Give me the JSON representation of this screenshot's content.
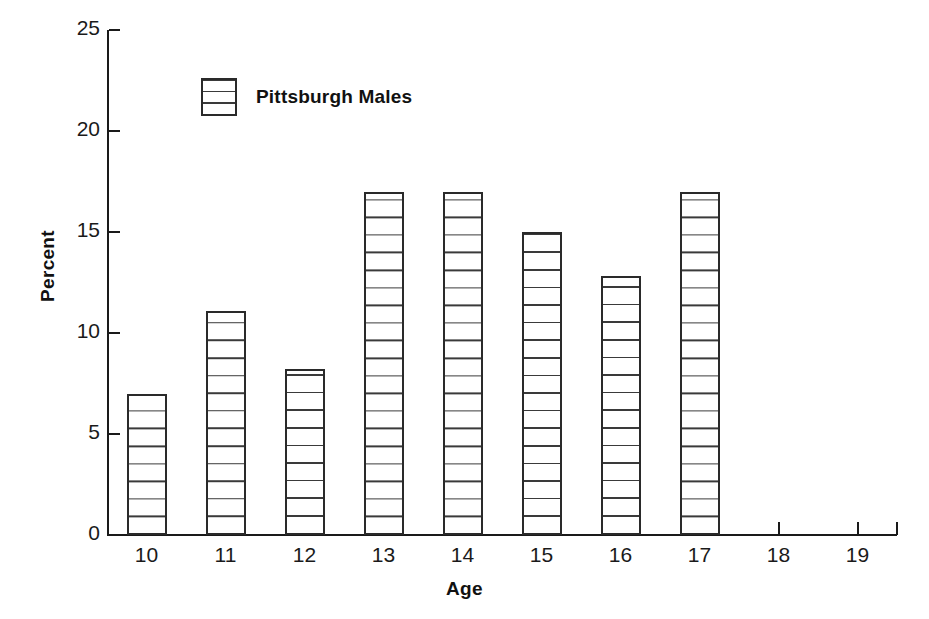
{
  "chart_data": {
    "type": "bar",
    "title": "",
    "xlabel": "Age",
    "ylabel": "Percent",
    "categories": [
      "10",
      "11",
      "12",
      "13",
      "14",
      "15",
      "16",
      "17",
      "18",
      "19"
    ],
    "values": [
      7.0,
      11.1,
      8.2,
      17.0,
      17.0,
      15.0,
      12.8,
      17.0,
      0,
      0
    ],
    "series": [
      {
        "name": "Pittsburgh Males",
        "values": [
          7.0,
          11.1,
          8.2,
          17.0,
          17.0,
          15.0,
          12.8,
          17.0,
          0,
          0
        ]
      }
    ],
    "ylim": [
      0,
      25
    ],
    "y_ticks": [
      "0",
      "5",
      "10",
      "15",
      "20",
      "25"
    ],
    "x_ticks": [
      "10",
      "11",
      "12",
      "13",
      "14",
      "15",
      "16",
      "17",
      "18",
      "19"
    ],
    "grid": false,
    "legend_position": "top-left-inside",
    "bar_fill": "horizontal-stripes",
    "colors": {
      "axis": "#1a1a1a",
      "bar_outline": "#2a2a2a",
      "bar_stripe": "#3a3a3a",
      "background": "#ffffff",
      "text": "#111111"
    }
  },
  "legend": {
    "entries": [
      {
        "label": "Pittsburgh Males",
        "swatch": "horizontal-stripe-box"
      }
    ]
  },
  "axes": {
    "y_title": "Percent",
    "x_title": "Age"
  },
  "caption": {
    "text": ""
  }
}
